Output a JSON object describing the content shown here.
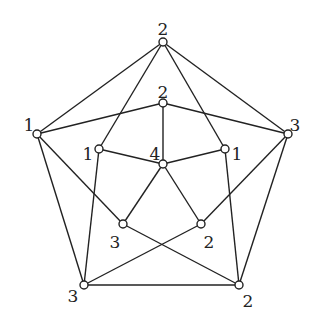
{
  "diagram": {
    "type": "graph",
    "colors": {
      "stroke": "#222222",
      "node_fill": "#ffffff",
      "background": "#ffffff"
    },
    "nodes": [
      {
        "id": "outer_top",
        "x": 163,
        "y": 42,
        "label": "2",
        "lx": 163,
        "ly": 30
      },
      {
        "id": "outer_right",
        "x": 288,
        "y": 134,
        "label": "3",
        "lx": 295,
        "ly": 126
      },
      {
        "id": "outer_bottom_right",
        "x": 239,
        "y": 285,
        "label": "2",
        "lx": 248,
        "ly": 302
      },
      {
        "id": "outer_bottom_left",
        "x": 84,
        "y": 285,
        "label": "3",
        "lx": 73,
        "ly": 297
      },
      {
        "id": "outer_left",
        "x": 37,
        "y": 134,
        "label": "1",
        "lx": 29,
        "ly": 126
      },
      {
        "id": "inner_top",
        "x": 163,
        "y": 103,
        "label": "2",
        "lx": 163,
        "ly": 93
      },
      {
        "id": "inner_right",
        "x": 225,
        "y": 149,
        "label": "1",
        "lx": 237,
        "ly": 155
      },
      {
        "id": "inner_bottom_right",
        "x": 201,
        "y": 224,
        "label": "2",
        "lx": 209,
        "ly": 243
      },
      {
        "id": "inner_bottom_left",
        "x": 123,
        "y": 224,
        "label": "3",
        "lx": 115,
        "ly": 243
      },
      {
        "id": "inner_left",
        "x": 99,
        "y": 149,
        "label": "1",
        "lx": 88,
        "ly": 155
      },
      {
        "id": "center",
        "x": 163,
        "y": 164,
        "label": "4",
        "lx": 155,
        "ly": 155
      }
    ],
    "edges": [
      [
        "outer_top",
        "outer_right"
      ],
      [
        "outer_top",
        "outer_left"
      ],
      [
        "outer_left",
        "outer_bottom_left"
      ],
      [
        "outer_right",
        "outer_bottom_right"
      ],
      [
        "outer_bottom_left",
        "outer_bottom_right"
      ],
      [
        "outer_top",
        "inner_left"
      ],
      [
        "outer_top",
        "inner_right"
      ],
      [
        "inner_top",
        "outer_left"
      ],
      [
        "inner_top",
        "outer_right"
      ],
      [
        "inner_top",
        "center"
      ],
      [
        "outer_left",
        "inner_bottom_left"
      ],
      [
        "outer_right",
        "inner_bottom_right"
      ],
      [
        "inner_left",
        "outer_bottom_left"
      ],
      [
        "inner_right",
        "outer_bottom_right"
      ],
      [
        "inner_bottom_left",
        "outer_bottom_right"
      ],
      [
        "inner_bottom_right",
        "outer_bottom_left"
      ],
      [
        "center",
        "inner_left"
      ],
      [
        "center",
        "inner_right"
      ],
      [
        "center",
        "inner_bottom_left"
      ],
      [
        "center",
        "inner_bottom_right"
      ]
    ]
  }
}
